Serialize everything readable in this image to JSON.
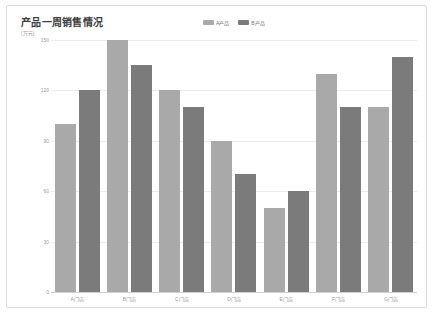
{
  "card": {
    "background": "#ffffff",
    "border_color": "#dcdcdc"
  },
  "chart_data": {
    "type": "bar",
    "title": "产品一周销售情况",
    "subtitle": "(万元)",
    "xlabel": "",
    "ylabel": "万元",
    "categories": [
      "A门店",
      "B门店",
      "C门店",
      "D门店",
      "E门店",
      "F门店",
      "G门店"
    ],
    "series": [
      {
        "name": "A产品",
        "color": "#a9a9a9",
        "values": [
          100,
          150,
          120,
          90,
          50,
          130,
          110
        ]
      },
      {
        "name": "B产品",
        "color": "#7b7b7b",
        "values": [
          120,
          135,
          110,
          70,
          60,
          110,
          140
        ]
      }
    ],
    "ylim": [
      0,
      150
    ],
    "yticks": [
      0,
      30,
      60,
      90,
      120,
      150
    ],
    "ytick_labels": [
      "0",
      "30",
      "60",
      "90",
      "120",
      "150"
    ],
    "grid": true,
    "grid_color": "#ececec",
    "legend_position": "top-right"
  }
}
